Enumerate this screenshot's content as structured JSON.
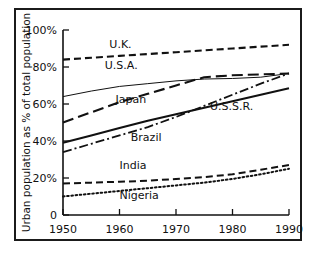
{
  "chart_data": {
    "type": "line",
    "title": "",
    "xlabel": "",
    "ylabel": "Urban population as % of total population",
    "xlim": [
      1950,
      1990
    ],
    "ylim": [
      0,
      100
    ],
    "xticks": [
      1950,
      1960,
      1970,
      1980,
      1990
    ],
    "xtick_labels": [
      "1950",
      "1960",
      "1970",
      "1980",
      "1990"
    ],
    "yticks": [
      0,
      20,
      40,
      60,
      80,
      100
    ],
    "ytick_labels": [
      "0",
      "20%",
      "40%",
      "60%",
      "80%",
      "100%"
    ],
    "grid": false,
    "legend": "inline-annotations",
    "x": [
      1950,
      1955,
      1960,
      1965,
      1970,
      1975,
      1980,
      1985,
      1990
    ],
    "series": [
      {
        "name": "U.K.",
        "label": "U.K.",
        "style": "dashed",
        "width": 2.1,
        "color": "#111111",
        "values": [
          84,
          85,
          86,
          87,
          88,
          89,
          90,
          91,
          92
        ]
      },
      {
        "name": "U.S.A.",
        "label": "U.S.A.",
        "style": "solid-thin",
        "width": 1.0,
        "color": "#111111",
        "values": [
          64,
          67,
          69.5,
          71,
          72.5,
          73.5,
          73.8,
          74.5,
          76.5
        ]
      },
      {
        "name": "Japan",
        "label": "Japan",
        "style": "long-dashed",
        "width": 2.1,
        "color": "#111111",
        "values": [
          50,
          55.5,
          61,
          65.5,
          70,
          74.5,
          75.5,
          76,
          76.5
        ]
      },
      {
        "name": "U.S.S.R.",
        "label": "U.S.S.R.",
        "style": "solid-thick",
        "width": 2.1,
        "color": "#111111",
        "values": [
          39,
          43,
          47,
          51,
          54.5,
          58,
          61.5,
          65,
          68.5
        ]
      },
      {
        "name": "Brazil",
        "label": "Brazil",
        "style": "dash-dot",
        "width": 1.8,
        "color": "#111111",
        "values": [
          34,
          38.5,
          43,
          47.5,
          53,
          59,
          65,
          71,
          76.5
        ]
      },
      {
        "name": "India",
        "label": "India",
        "style": "dashed",
        "width": 2.0,
        "color": "#111111",
        "values": [
          17,
          17.5,
          18,
          18.5,
          19.5,
          20.5,
          22,
          24.5,
          27
        ]
      },
      {
        "name": "Nigeria",
        "label": "Nigeria",
        "style": "dotted",
        "width": 2.0,
        "color": "#111111",
        "values": [
          10,
          11.5,
          13,
          14.5,
          16,
          17.5,
          19.5,
          22,
          25
        ]
      }
    ],
    "annotations": [
      {
        "text": "U.K.",
        "x": 1958.2,
        "y": 90.5,
        "rotation": 0
      },
      {
        "text": "U.S.A.",
        "x": 1957.4,
        "y": 79.0,
        "rotation": 0
      },
      {
        "text": "Japan",
        "x": 1959.3,
        "y": 60.5,
        "rotation": 0
      },
      {
        "text": "U.S.S.R.",
        "x": 1976.0,
        "y": 57.0,
        "rotation": 0
      },
      {
        "text": "Brazil",
        "x": 1962.0,
        "y": 40.0,
        "rotation": 0
      },
      {
        "text": "India",
        "x": 1960.0,
        "y": 25.0,
        "rotation": 0
      },
      {
        "text": "Nigeria",
        "x": 1960.0,
        "y": 8.5,
        "rotation": 0
      }
    ]
  }
}
